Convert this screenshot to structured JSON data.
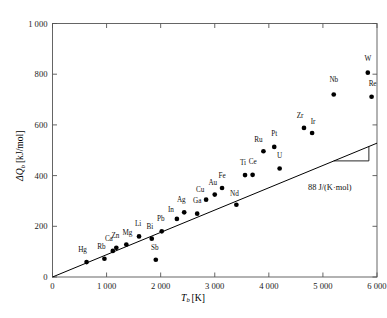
{
  "chart_data": {
    "type": "scatter",
    "title": "",
    "xlabel": "T_b [K]",
    "xlabel_symbol": "T",
    "xlabel_sub": "b",
    "xlabel_unit": "[K]",
    "ylabel": "ΔQ_b [kJ/mol]",
    "ylabel_symbol": "ΔQ",
    "ylabel_sub": "b",
    "ylabel_unit": "[kJ/mol]",
    "xlim": [
      0,
      6000
    ],
    "ylim": [
      0,
      1000
    ],
    "xticks": [
      0,
      1000,
      2000,
      3000,
      4000,
      5000,
      6000
    ],
    "xtick_labels": [
      "0",
      "1 000",
      "2 000",
      "3 000",
      "4 000",
      "5 000",
      "6 000"
    ],
    "yticks": [
      0,
      200,
      400,
      600,
      800,
      1000
    ],
    "ytick_labels": [
      "0",
      "200",
      "400",
      "600",
      "800",
      "1 000"
    ],
    "grid": false,
    "legend": null,
    "marker_color": "#000000",
    "line_color": "#000000",
    "points": [
      {
        "label": "Hg",
        "x": 630,
        "y": 59,
        "lx": -4,
        "ly": -5
      },
      {
        "label": "Rb",
        "x": 960,
        "y": 72,
        "lx": -3,
        "ly": -5
      },
      {
        "label": "Ca",
        "x": 1115,
        "y": 103,
        "lx": -4,
        "ly": -5
      },
      {
        "label": "Zn",
        "x": 1180,
        "y": 115,
        "lx": -1,
        "ly": -5
      },
      {
        "label": "Mg",
        "x": 1365,
        "y": 128,
        "lx": 1,
        "ly": -5
      },
      {
        "label": "Li",
        "x": 1600,
        "y": 160,
        "lx": -1,
        "ly": -5
      },
      {
        "label": "Bi",
        "x": 1835,
        "y": 151,
        "lx": -2,
        "ly": -5
      },
      {
        "label": "Pb",
        "x": 2020,
        "y": 180,
        "lx": -1,
        "ly": -5
      },
      {
        "label": "Sb",
        "x": 1910,
        "y": 68,
        "lx": -1,
        "ly": -5
      },
      {
        "label": "In",
        "x": 2300,
        "y": 229,
        "lx": -6,
        "ly": -2
      },
      {
        "label": "Ag",
        "x": 2435,
        "y": 255,
        "lx": -3,
        "ly": -5
      },
      {
        "label": "Ga",
        "x": 2675,
        "y": 250,
        "lx": 0,
        "ly": -6
      },
      {
        "label": "Cu",
        "x": 2840,
        "y": 305,
        "lx": -6,
        "ly": -3
      },
      {
        "label": "Au",
        "x": 3000,
        "y": 325,
        "lx": -2,
        "ly": -5
      },
      {
        "label": "Fe",
        "x": 3135,
        "y": 351,
        "lx": 0,
        "ly": -5
      },
      {
        "label": "Nd",
        "x": 3400,
        "y": 285,
        "lx": -2,
        "ly": -4
      },
      {
        "label": "Ti",
        "x": 3560,
        "y": 402,
        "lx": -2,
        "ly": -5
      },
      {
        "label": "Ce",
        "x": 3700,
        "y": 403,
        "lx": 0,
        "ly": -6
      },
      {
        "label": "Ru",
        "x": 3900,
        "y": 496,
        "lx": -5,
        "ly": -4
      },
      {
        "label": "Pt",
        "x": 4100,
        "y": 513,
        "lx": 0,
        "ly": -6
      },
      {
        "label": "U",
        "x": 4200,
        "y": 428,
        "lx": 0,
        "ly": -6
      },
      {
        "label": "Zr",
        "x": 4650,
        "y": 588,
        "lx": -4,
        "ly": -5
      },
      {
        "label": "Ir",
        "x": 4800,
        "y": 568,
        "lx": 1,
        "ly": -4
      },
      {
        "label": "Nb",
        "x": 5200,
        "y": 720,
        "lx": 0,
        "ly": -7
      },
      {
        "label": "W",
        "x": 5830,
        "y": 806,
        "lx": 0,
        "ly": -7
      },
      {
        "label": "Re",
        "x": 5900,
        "y": 711,
        "lx": 1,
        "ly": -6
      }
    ],
    "fit_line": {
      "slope": 88,
      "intercept": 0,
      "x_start": 0,
      "x_end": 6000,
      "y_start": 0,
      "y_end": 528
    },
    "slope_annotation": {
      "text": "88 J/(K·mol)",
      "triangle": {
        "x_start": 5200,
        "x_end": 5850,
        "y_base": 458,
        "y_top": 515
      }
    }
  }
}
